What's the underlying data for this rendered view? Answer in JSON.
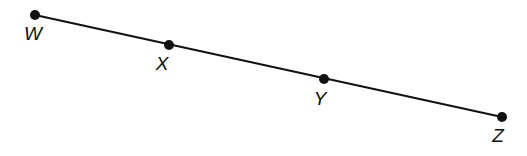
{
  "diagram": {
    "type": "line-segment-with-points",
    "line": {
      "from": [
        35,
        15
      ],
      "to": [
        502,
        117
      ],
      "color": "#111111"
    },
    "points": [
      {
        "id": "W",
        "label": "W",
        "x": 35,
        "y": 15,
        "lx": 33,
        "ly": 40
      },
      {
        "id": "X",
        "label": "X",
        "x": 169,
        "y": 45,
        "lx": 162,
        "ly": 70
      },
      {
        "id": "Y",
        "label": "Y",
        "x": 324,
        "y": 79,
        "lx": 320,
        "ly": 105
      },
      {
        "id": "Z",
        "label": "Z",
        "x": 502,
        "y": 117,
        "lx": 498,
        "ly": 142
      }
    ]
  }
}
